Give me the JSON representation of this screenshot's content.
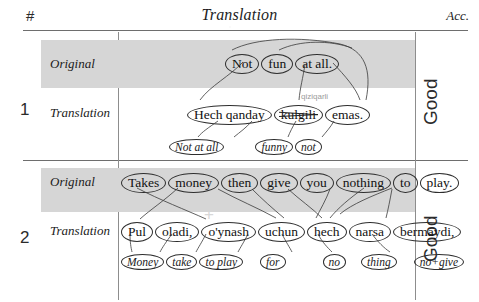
{
  "header": {
    "index_label": "#",
    "translation_label": "Translation",
    "accuracy_label": "Acc."
  },
  "labels": {
    "original": "Original",
    "translation": "Translation"
  },
  "colors": {
    "band": "#d6d6d6",
    "rule": "#6e6e6e",
    "ellipse": "#2e2e2e",
    "correction_text": "#9a9a9a",
    "watermark": "#d8d8d8"
  },
  "rows": [
    {
      "number": "1",
      "accuracy": "Good",
      "original": {
        "label": "Original",
        "tokens": [
          "Not",
          "fun",
          "at  all."
        ]
      },
      "translation": {
        "label": "Translation",
        "tokens": [
          "Hech  qanday",
          "kulgili",
          "emas."
        ],
        "struck_token_index": 1,
        "correction": "qiziqarli"
      },
      "gloss": {
        "tokens": [
          "Not at all",
          "funny",
          "not"
        ]
      }
    },
    {
      "number": "2",
      "accuracy": "Good",
      "original": {
        "label": "Original",
        "tokens": [
          "Takes",
          "money",
          "then",
          "give",
          "you",
          "nothing",
          "to",
          "play."
        ]
      },
      "translation": {
        "label": "Translation",
        "tokens": [
          "Pul",
          "oladi,",
          "o'ynash",
          "uchun",
          "hech",
          "narsa",
          "bermaydi,"
        ]
      },
      "gloss": {
        "tokens": [
          "Money",
          "take",
          "to play",
          "for",
          "no",
          "thing",
          "no+give"
        ]
      }
    }
  ],
  "watermark": "+"
}
